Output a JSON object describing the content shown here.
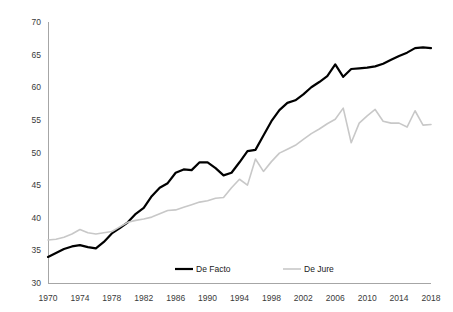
{
  "chart_data": {
    "type": "line",
    "title": "",
    "subtitle": "",
    "xlabel": "",
    "ylabel": "",
    "xlim": [
      1970,
      2018
    ],
    "ylim": [
      30,
      70
    ],
    "ytick_step": 5,
    "xtick_step": 4,
    "grid": false,
    "legend_position": "bottom-center",
    "yticks": [
      "30",
      "35",
      "40",
      "45",
      "50",
      "55",
      "60",
      "65",
      "70"
    ],
    "xticks": [
      "1970",
      "1974",
      "1978",
      "1982",
      "1986",
      "1990",
      "1994",
      "1998",
      "2002",
      "2006",
      "2010",
      "2014",
      "2018"
    ],
    "x": [
      1970,
      1971,
      1972,
      1973,
      1974,
      1975,
      1976,
      1977,
      1978,
      1979,
      1980,
      1981,
      1982,
      1983,
      1984,
      1985,
      1986,
      1987,
      1988,
      1989,
      1990,
      1991,
      1992,
      1993,
      1994,
      1995,
      1996,
      1997,
      1998,
      1999,
      2000,
      2001,
      2002,
      2003,
      2004,
      2005,
      2006,
      2007,
      2008,
      2009,
      2010,
      2011,
      2012,
      2013,
      2014,
      2015,
      2016,
      2017,
      2018
    ],
    "series": [
      {
        "name": "De Facto",
        "color": "#000000",
        "width": 2.2,
        "values": [
          34.0,
          34.6,
          35.2,
          35.6,
          35.8,
          35.5,
          35.3,
          36.3,
          37.6,
          38.4,
          39.3,
          40.6,
          41.5,
          43.3,
          44.6,
          45.3,
          46.9,
          47.4,
          47.3,
          48.5,
          48.5,
          47.6,
          46.5,
          46.9,
          48.5,
          50.2,
          50.4,
          52.6,
          54.8,
          56.5,
          57.6,
          58.0,
          58.9,
          60.0,
          60.8,
          61.7,
          63.5,
          61.6,
          62.8,
          62.9,
          63.0,
          63.2,
          63.6,
          64.2,
          64.8,
          65.3,
          66.0,
          66.1,
          66.0
        ]
      },
      {
        "name": "De Jure",
        "color": "#c8c8c8",
        "width": 1.6,
        "values": [
          36.6,
          36.7,
          37.0,
          37.5,
          38.2,
          37.7,
          37.5,
          37.7,
          37.9,
          38.6,
          39.3,
          39.6,
          39.8,
          40.1,
          40.6,
          41.1,
          41.2,
          41.6,
          42.0,
          42.4,
          42.6,
          43.0,
          43.1,
          44.6,
          45.9,
          45.0,
          49.0,
          47.1,
          48.6,
          49.9,
          50.5,
          51.1,
          52.0,
          52.9,
          53.6,
          54.4,
          55.1,
          56.8,
          51.5,
          54.5,
          55.6,
          56.6,
          54.8,
          54.5,
          54.5,
          53.9,
          56.4,
          54.2,
          54.3
        ]
      }
    ]
  },
  "legend": {
    "entries": [
      {
        "label": "De Facto"
      },
      {
        "label": "De Jure"
      }
    ]
  }
}
